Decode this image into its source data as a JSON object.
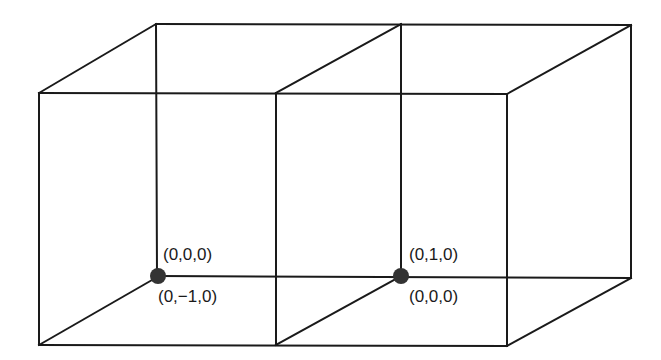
{
  "diagram": {
    "type": "two adjacent unit cubes in oblique projection",
    "colors": {
      "line": "#1a1a1a",
      "point": "#333333",
      "background": "#ffffff"
    },
    "points": [
      {
        "id": "p1",
        "label_upper": "(0,0,0)",
        "label_lower": "(0,−1,0)"
      },
      {
        "id": "p2",
        "label_upper": "(0,1,0)",
        "label_lower": "(0,0,0)"
      }
    ]
  }
}
